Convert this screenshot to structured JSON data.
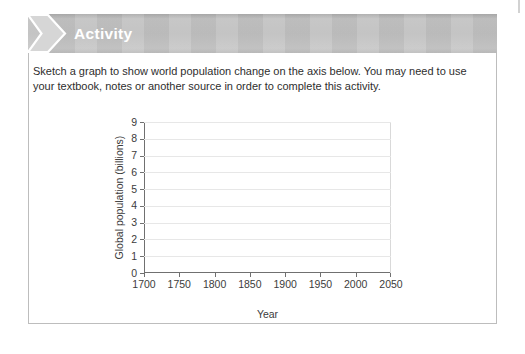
{
  "banner": {
    "title": "Activity",
    "chevron_icon": "chevron-right-icon"
  },
  "instructions": {
    "lines": [
      "Sketch a graph to show world population change on the axis below. You may need to use",
      "your textbook, notes or another source in order to complete this activity."
    ]
  },
  "chart_data": {
    "type": "line",
    "title": "",
    "xlabel": "Year",
    "ylabel": "Global population (billions)",
    "xlim": [
      1700,
      2050
    ],
    "ylim": [
      0,
      9
    ],
    "x_ticks": [
      1700,
      1750,
      1800,
      1850,
      1900,
      1950,
      2000,
      2050
    ],
    "y_ticks": [
      0,
      1,
      2,
      3,
      4,
      5,
      6,
      7,
      8,
      9
    ],
    "grid": "horizontal",
    "legend_position": "none",
    "series": []
  },
  "colors": {
    "banner_background": "#c1c1c1",
    "banner_title": "#ffffff",
    "chevron_fill": "#d6d6d6",
    "chevron_outline": "#ffffff",
    "card_border": "#bdbdbd",
    "axis": "#707070",
    "gridline": "#e7e7e7",
    "body_text": "#2e2e2e"
  }
}
